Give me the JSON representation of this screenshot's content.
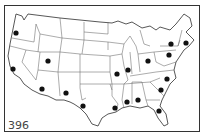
{
  "figure": {
    "number": "396"
  },
  "colors": {
    "background": "#ffffff",
    "outline": "#444444",
    "dot": "#111111"
  },
  "markers": [
    {
      "id": "oregon",
      "x": 16,
      "y": 33
    },
    {
      "id": "california",
      "x": 13,
      "y": 69
    },
    {
      "id": "utah",
      "x": 48,
      "y": 61
    },
    {
      "id": "arizona",
      "x": 42,
      "y": 89
    },
    {
      "id": "new-mexico",
      "x": 66,
      "y": 93
    },
    {
      "id": "texas",
      "x": 83,
      "y": 106
    },
    {
      "id": "missouri",
      "x": 117,
      "y": 74
    },
    {
      "id": "illinois",
      "x": 128,
      "y": 70
    },
    {
      "id": "ohio",
      "x": 148,
      "y": 61
    },
    {
      "id": "new-york",
      "x": 171,
      "y": 44
    },
    {
      "id": "massachusetts",
      "x": 186,
      "y": 43
    },
    {
      "id": "pennsylvania",
      "x": 169,
      "y": 55
    },
    {
      "id": "north-carolina",
      "x": 167,
      "y": 79
    },
    {
      "id": "south-carolina",
      "x": 161,
      "y": 90
    },
    {
      "id": "alabama",
      "x": 138,
      "y": 100
    },
    {
      "id": "mississippi",
      "x": 127,
      "y": 102
    },
    {
      "id": "louisiana",
      "x": 115,
      "y": 108
    },
    {
      "id": "florida",
      "x": 159,
      "y": 111
    }
  ]
}
